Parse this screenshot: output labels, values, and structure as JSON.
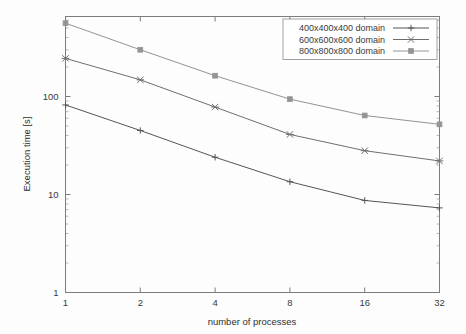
{
  "chart_data": {
    "type": "line",
    "title": "",
    "subtitle": "",
    "xlabel": "number of processes",
    "ylabel": "Execution time [s]",
    "xscale": "log2",
    "yscale": "log10",
    "x": [
      1,
      2,
      4,
      8,
      16,
      32
    ],
    "xticklabels": [
      "1",
      "2",
      "4",
      "8",
      "16",
      "32"
    ],
    "yticklabels": [
      "1",
      "10",
      "100"
    ],
    "ytickvalues": [
      1,
      10,
      100
    ],
    "xlim": [
      1,
      32
    ],
    "ylim": [
      1,
      600
    ],
    "grid": false,
    "legend_position": "top-right",
    "minor_ticks": true,
    "series": [
      {
        "name": "400x400x400 domain",
        "label": "400x400x400 domain",
        "marker": "plus",
        "color": "#555555",
        "values": [
          82,
          45,
          24,
          13.5,
          8.7,
          7.3
        ]
      },
      {
        "name": "600x600x600 domain",
        "label": "600x600x600 domain",
        "marker": "cross",
        "color": "#6e6e6e",
        "values": [
          245,
          148,
          78,
          41,
          28,
          22
        ]
      },
      {
        "name": "800x800x800 domain",
        "label": "800x800x800 domain",
        "marker": "square",
        "color": "#949494",
        "values": [
          560,
          300,
          163,
          94,
          64,
          52
        ]
      }
    ]
  },
  "colors": {
    "background": "#fdfdfd",
    "frame": "#7d7d7d",
    "text": "#3a3a3a",
    "series_400": "#555555",
    "series_600": "#6e6e6e",
    "series_800": "#949494"
  }
}
